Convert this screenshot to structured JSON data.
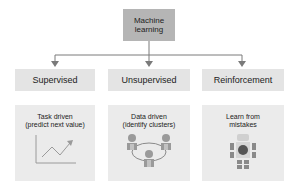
{
  "root": {
    "label": "Machine\nlearning"
  },
  "categories": [
    {
      "label": "Supervised",
      "description": "Task driven\n(predict next value)",
      "icon": "line-chart-icon"
    },
    {
      "label": "Unsupervised",
      "description": "Data driven\n(identify clusters)",
      "icon": "people-cluster-icon"
    },
    {
      "label": "Reinforcement",
      "description": "Learn from\nmistakes",
      "icon": "robot-icon"
    }
  ],
  "colors": {
    "root_fill": "#b5b5b5",
    "category_fill": "#e4e4e4",
    "card_fill": "#ebebeb",
    "connector": "#777777"
  }
}
